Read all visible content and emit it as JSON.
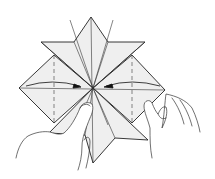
{
  "diagram": {
    "type": "origami-step",
    "description": "Square base unfolded into star shape; both side flaps folded toward the center along dashed valley lines while hands hold the model",
    "colors": {
      "line": "#222222",
      "paper": "#efefef",
      "background": "#ffffff",
      "arrow": "#111111"
    },
    "elements": {
      "paper_model": "star-shaped folded paper",
      "valley_lines": 2,
      "fold_arrows": 2,
      "hands": 2
    }
  }
}
